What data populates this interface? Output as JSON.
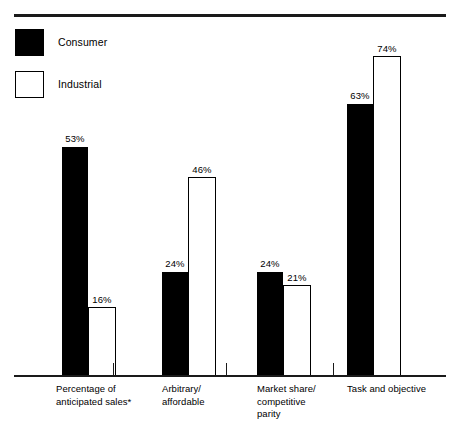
{
  "legend": {
    "items": [
      {
        "label": "Consumer",
        "style": "filled",
        "color": "#000000"
      },
      {
        "label": "Industrial",
        "style": "hollow",
        "color": "#ffffff"
      }
    ]
  },
  "chart_data": {
    "type": "bar",
    "title": "",
    "subtitle": "",
    "xlabel": "",
    "ylabel": "",
    "ylim": [
      0,
      80
    ],
    "grid": false,
    "legend_position": "top-left",
    "value_suffix": "%",
    "categories": [
      "Percentage of\nanticipated sales*",
      "Arbitrary/\naffordable",
      "Market share/\ncompetitive\nparity",
      "Task and objective"
    ],
    "series": [
      {
        "name": "Consumer",
        "values": [
          53,
          24,
          24,
          63
        ]
      },
      {
        "name": "Industrial",
        "values": [
          16,
          46,
          21,
          74
        ]
      }
    ],
    "data_labels": [
      [
        "53%",
        "16%"
      ],
      [
        "24%",
        "46%"
      ],
      [
        "24%",
        "21%"
      ],
      [
        "63%",
        "74%"
      ]
    ],
    "footnote_marker": "*"
  }
}
